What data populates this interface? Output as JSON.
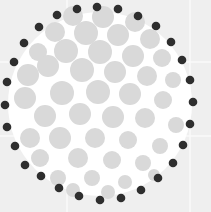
{
  "canvas": {
    "width": 211,
    "height": 212,
    "background": "#efefef",
    "gridline_color": "#fafafa"
  },
  "gridlines": {
    "vertical": [
      67,
      190
    ],
    "horizontal": [
      62,
      136
    ]
  },
  "disc": {
    "cx": 100,
    "cy": 104,
    "r": 92,
    "fill": "#ffffff"
  },
  "colors": {
    "light_dot": "#d9d9d9",
    "dark_dot": "#2e2e2e"
  },
  "dark_dots": {
    "r": 4.3,
    "points": [
      [
        97,
        7
      ],
      [
        118,
        9
      ],
      [
        138,
        16
      ],
      [
        156,
        26
      ],
      [
        171,
        42
      ],
      [
        182,
        60
      ],
      [
        190,
        80
      ],
      [
        193,
        102
      ],
      [
        190,
        124
      ],
      [
        183,
        145
      ],
      [
        173,
        163
      ],
      [
        158,
        178
      ],
      [
        141,
        190
      ],
      [
        121,
        198
      ],
      [
        100,
        200
      ],
      [
        79,
        196
      ],
      [
        59,
        188
      ],
      [
        41,
        176
      ],
      [
        25,
        165
      ],
      [
        15,
        146
      ],
      [
        7,
        127
      ],
      [
        5,
        105
      ],
      [
        7,
        82
      ],
      [
        14,
        62
      ],
      [
        24,
        43
      ],
      [
        39,
        27
      ],
      [
        57,
        15
      ],
      [
        77,
        9
      ]
    ]
  },
  "light_dots": {
    "points": [
      [
        73,
        16,
        10
      ],
      [
        103,
        17,
        11
      ],
      [
        135,
        22,
        10
      ],
      [
        55,
        32,
        10
      ],
      [
        86,
        33,
        12
      ],
      [
        118,
        35,
        11
      ],
      [
        150,
        39,
        10
      ],
      [
        38,
        52,
        9
      ],
      [
        66,
        51,
        12
      ],
      [
        100,
        52,
        12
      ],
      [
        133,
        56,
        11
      ],
      [
        162,
        58,
        9
      ],
      [
        28,
        75,
        11
      ],
      [
        48,
        66,
        11
      ],
      [
        82,
        70,
        12
      ],
      [
        115,
        72,
        11
      ],
      [
        147,
        76,
        10
      ],
      [
        173,
        80,
        8
      ],
      [
        25,
        98,
        11
      ],
      [
        62,
        93,
        12
      ],
      [
        98,
        92,
        12
      ],
      [
        130,
        94,
        11
      ],
      [
        163,
        100,
        9
      ],
      [
        45,
        116,
        11
      ],
      [
        80,
        114,
        11
      ],
      [
        113,
        117,
        11
      ],
      [
        145,
        118,
        10
      ],
      [
        176,
        125,
        8
      ],
      [
        30,
        138,
        10
      ],
      [
        60,
        138,
        11
      ],
      [
        95,
        138,
        10
      ],
      [
        128,
        140,
        9
      ],
      [
        160,
        146,
        8
      ],
      [
        40,
        158,
        9
      ],
      [
        78,
        158,
        10
      ],
      [
        112,
        160,
        9
      ],
      [
        143,
        163,
        8
      ],
      [
        58,
        178,
        8
      ],
      [
        92,
        178,
        8
      ],
      [
        125,
        182,
        7
      ],
      [
        154,
        175,
        6
      ],
      [
        73,
        190,
        7
      ],
      [
        108,
        192,
        7
      ]
    ]
  }
}
